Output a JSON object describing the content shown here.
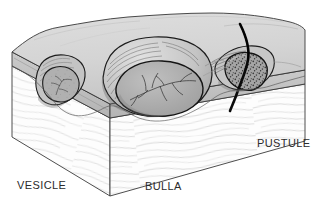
{
  "figure": {
    "width": 328,
    "height": 215,
    "background_color": "#ffffff"
  },
  "labels": {
    "vesicle": "VESICLE",
    "bulla": "BULLA",
    "pustule": "PUSTULE"
  },
  "colors": {
    "background": "#ffffff",
    "epidermis_top": "#d6d6d6",
    "epidermis_top_shadow": "#bdbdbd",
    "epidermis_cut_face": "#c2c2c2",
    "dermis": "#fdfdfd",
    "dermis_fiber": "#b9b9b9",
    "lesion_fluid": "#a9a9a9",
    "lesion_fluid_light": "#bcbcbc",
    "lesion_roof": "#c9c9c9",
    "pustule_pus": "#9a9a9a",
    "outline": "#1a1a1a",
    "hair_shaft": "#0a0a0a",
    "label_text": "#2b2b2b"
  },
  "structures": {
    "vesicle": {
      "name": "vesicle",
      "kind": "small blister",
      "position": "left",
      "contents": "clear fluid",
      "roof": "thin epidermal roof",
      "interior_pattern": "fine branching septa"
    },
    "bulla": {
      "name": "bulla",
      "kind": "large blister",
      "position": "center",
      "contents": "clear fluid",
      "roof": "domed epidermal roof with radial striations",
      "interior_pattern": "branching vascular / septal tree"
    },
    "pustule": {
      "name": "pustule",
      "kind": "pus-filled lesion",
      "position": "right",
      "contents": "purulent exudate",
      "feature": "hair shaft passing through the lesion",
      "interior_pattern": "dense stippling"
    }
  },
  "layers": [
    {
      "name": "epidermis",
      "appearance": "smooth gray surface slab"
    },
    {
      "name": "dermis",
      "appearance": "white with wavy collagen fiber lines"
    }
  ]
}
